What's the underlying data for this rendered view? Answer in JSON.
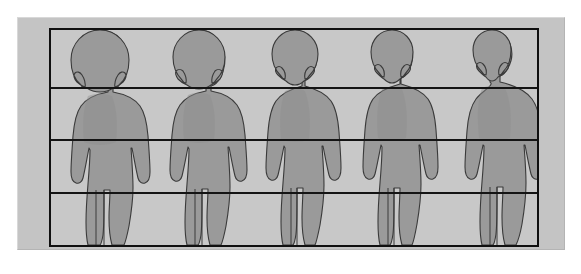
{
  "figure": {
    "title": "Human body proportions by age",
    "type": "proportion-diagram",
    "colors": {
      "page_background": "#ffffff",
      "frame_background": "#c4c4c4",
      "panel_background": "#c8c8c8",
      "figure_fill": "#9a9a9a",
      "figure_outline": "#3a3a3a",
      "grid_line": "#141414",
      "border": "#101010"
    },
    "panel": {
      "x": 50,
      "y": 29,
      "width": 488,
      "height": 217,
      "border_width": 2
    },
    "grid": {
      "orientation": "horizontal",
      "band_count": 4,
      "line_count": 3,
      "line_y": [
        88,
        140,
        193
      ],
      "line_width": 2,
      "labels": []
    },
    "figures": [
      {
        "index": 1,
        "name": "infant",
        "head_units": 4,
        "center_x": 100,
        "scale": 1.0,
        "build": "chubby"
      },
      {
        "index": 2,
        "name": "toddler",
        "head_units": 5,
        "center_x": 199,
        "scale": 0.98,
        "build": "sturdy"
      },
      {
        "index": 3,
        "name": "child",
        "head_units": 6,
        "center_x": 295,
        "scale": 0.97,
        "build": "slim"
      },
      {
        "index": 4,
        "name": "adolescent",
        "head_units": 7,
        "center_x": 392,
        "scale": 0.97,
        "build": "lean"
      },
      {
        "index": 5,
        "name": "adult",
        "head_units": 8,
        "center_x": 492,
        "scale": 0.98,
        "build": "broad-shouldered"
      }
    ],
    "axis_labels": {
      "x": "",
      "y": ""
    },
    "annotations": []
  }
}
